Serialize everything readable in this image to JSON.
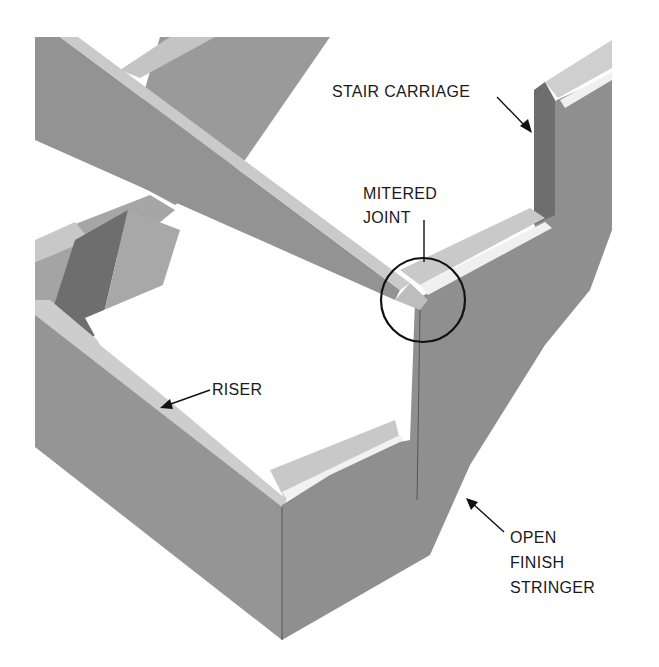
{
  "diagram": {
    "labels": {
      "stair_carriage": "STAIR CARRIAGE",
      "mitered_joint_line1": "MITERED",
      "mitered_joint_line2": "JOINT",
      "riser": "RISER",
      "open_finish_stringer_line1": "OPEN",
      "open_finish_stringer_line2": "FINISH",
      "open_finish_stringer_line3": "STRINGER"
    },
    "colors": {
      "face_mid": "#8f8f8f",
      "face_dark": "#6e6e6e",
      "face_light": "#b4b4b4",
      "edge_light": "#cfcfcf",
      "highlight": "#f2f2f2",
      "callout": "#111111"
    }
  }
}
